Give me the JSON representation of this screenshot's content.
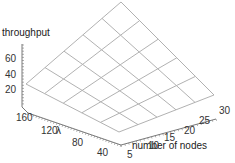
{
  "chart_data": {
    "type": "surface3d",
    "title": "",
    "zlabel": "throughput",
    "xlabel": "number of nodes",
    "ylabel": "λ",
    "x_ticks": [
      5,
      10,
      15,
      20,
      25,
      30
    ],
    "y_ticks": [
      40,
      80,
      120,
      160
    ],
    "z_ticks": [
      20,
      40,
      60
    ],
    "x_range": [
      5,
      30
    ],
    "y_range": [
      20,
      180
    ],
    "z_range": [
      0,
      80
    ],
    "grid_x": [
      5,
      10,
      15,
      20,
      25,
      30
    ],
    "grid_y": [
      20,
      52,
      84,
      116,
      148,
      180
    ],
    "surface_z": [
      [
        37,
        42,
        47,
        52,
        57,
        62
      ],
      [
        42,
        47,
        52,
        57,
        62,
        67
      ],
      [
        47,
        52,
        57,
        62,
        67,
        72
      ],
      [
        52,
        57,
        62,
        67,
        72,
        77
      ],
      [
        57,
        62,
        67,
        72,
        77,
        80
      ],
      [
        62,
        67,
        72,
        77,
        80,
        80
      ]
    ],
    "mesh": "wireframe 5x5",
    "grid": false,
    "legend": "none"
  },
  "labels": {
    "z_axis": "throughput",
    "x_axis": "number of nodes",
    "y_axis": "λ",
    "z_ticks": [
      "60",
      "40",
      "20"
    ],
    "y_ticks": [
      "160",
      "120",
      "80",
      "40"
    ],
    "x_ticks": [
      "5",
      "10",
      "15",
      "20",
      "25",
      "30"
    ]
  }
}
